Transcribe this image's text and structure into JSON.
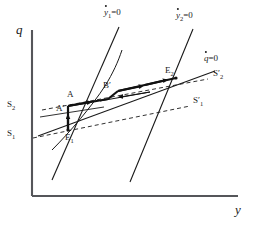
{
  "figure": {
    "type": "phase-diagram",
    "axes": {
      "y_axis_label": "y",
      "q_axis_label": "q",
      "origin_px": [
        32,
        196
      ],
      "x_max_px": 238,
      "y_top_px": 30
    },
    "loci": [
      {
        "name": "ydot1-locus",
        "label_var": "y",
        "label_sub": "1",
        "label_eq": "=0",
        "style": "solid-steep",
        "from_px": [
          52,
          178
        ],
        "to_px": [
          118,
          28
        ]
      },
      {
        "name": "ydot2-locus",
        "label_var": "y",
        "label_sub": "2",
        "label_eq": "=0",
        "style": "solid-steep",
        "from_px": [
          131,
          180
        ],
        "to_px": [
          192,
          30
        ]
      },
      {
        "name": "qdot-locus",
        "label_var": "q",
        "label_sub": "",
        "label_eq": "=0",
        "style": "solid-shallow",
        "from_px": [
          40,
          134
        ],
        "to_px": [
          214,
          73
        ]
      },
      {
        "name": "saddle-path-curve",
        "label_var": "",
        "label_sub": "",
        "label_eq": "",
        "style": "curve",
        "from_px": [
          52,
          145
        ],
        "to_px": [
          140,
          52
        ]
      }
    ],
    "dashed_lines": [
      {
        "name": "s1-prime-line",
        "left_label": "S",
        "left_sub": "1",
        "right_label": "S",
        "right_sub": "1",
        "right_prime": "′",
        "from_px": [
          34,
          137
        ],
        "to_px": [
          188,
          106
        ]
      },
      {
        "name": "s2-prime-line",
        "left_label": "S",
        "left_sub": "2",
        "right_label": "S",
        "right_sub": "2",
        "right_prime": "′",
        "from_px": [
          42,
          109
        ],
        "to_px": [
          205,
          80
        ]
      }
    ],
    "labels": [
      {
        "name": "label-q-axis",
        "text": "q",
        "sub": "",
        "prime": "",
        "x": 16,
        "y": 30,
        "class": "axis-name"
      },
      {
        "name": "label-y-axis",
        "text": "y",
        "sub": "",
        "prime": "",
        "x": 236,
        "y": 207,
        "class": "axis-name"
      },
      {
        "name": "label-S2-left",
        "text": "S",
        "sub": "2",
        "prime": "",
        "x": 8,
        "y": 103,
        "class": "point-label"
      },
      {
        "name": "label-S1-left",
        "text": "S",
        "sub": "1",
        "prime": "",
        "x": 8,
        "y": 132,
        "class": "point-label"
      },
      {
        "name": "label-S2-right",
        "text": "S",
        "sub": "2",
        "prime": "′",
        "x": 214,
        "y": 72,
        "class": "point-label"
      },
      {
        "name": "label-S1-right",
        "text": "S",
        "sub": "1",
        "prime": "′",
        "x": 194,
        "y": 99,
        "class": "point-label"
      },
      {
        "name": "label-A",
        "text": "A",
        "sub": "",
        "prime": "",
        "x": 68,
        "y": 94,
        "class": "point-label"
      },
      {
        "name": "label-A-prime",
        "text": "A",
        "sub": "",
        "prime": "′",
        "x": 57,
        "y": 108,
        "class": "point-label"
      },
      {
        "name": "label-B-prime",
        "text": "B",
        "sub": "",
        "prime": "′",
        "x": 104,
        "y": 85,
        "class": "point-label"
      },
      {
        "name": "label-E1",
        "text": "E",
        "sub": "1",
        "prime": "",
        "x": 66,
        "y": 136,
        "class": "point-label"
      },
      {
        "name": "label-E2",
        "text": "E",
        "sub": "2",
        "prime": "",
        "x": 166,
        "y": 70,
        "class": "point-label"
      }
    ],
    "locus_labels": [
      {
        "name": "label-ydot1-eq0",
        "var": "y",
        "sub": "1",
        "eq": "=0",
        "x": 105,
        "y": 10
      },
      {
        "name": "label-ydot2-eq0",
        "var": "y",
        "sub": "2",
        "eq": "=0",
        "x": 177,
        "y": 13
      },
      {
        "name": "label-qdot-eq0",
        "var": "q",
        "sub": "",
        "eq": "=0",
        "x": 205,
        "y": 56
      }
    ],
    "trajectory": {
      "name": "adjustment-path",
      "description": "arrowed path from E1 up to A' then along to E2",
      "arrow_count": 5
    },
    "colors": {
      "ink": "#1a1a1a",
      "axis": "#55565a",
      "background": "#ffffff"
    }
  }
}
